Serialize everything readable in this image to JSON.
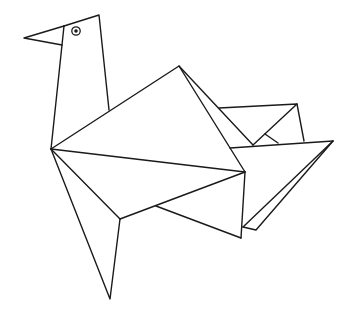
{
  "image": {
    "title": "Origami turkey line drawing",
    "background": "#ffffff",
    "stroke_color": "#1a1a1a"
  },
  "figure": {
    "parts": [
      {
        "name": "head",
        "label": "Head"
      },
      {
        "name": "beak",
        "label": "Beak"
      },
      {
        "name": "eye",
        "label": "Eye"
      },
      {
        "name": "neck",
        "label": "Neck"
      },
      {
        "name": "wing",
        "label": "Wing"
      },
      {
        "name": "body",
        "label": "Body"
      },
      {
        "name": "tail",
        "label": "Tail"
      },
      {
        "name": "leg",
        "label": "Leg"
      }
    ]
  }
}
